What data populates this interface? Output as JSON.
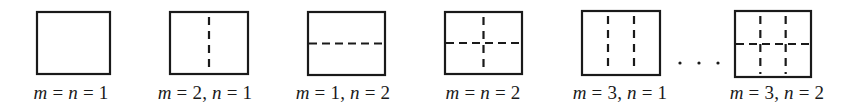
{
  "figure": {
    "stroke_color": "#1a1a1a",
    "panels": [
      {
        "id": "p1",
        "m": 1,
        "n": 1,
        "label_parts": [
          "m",
          " = ",
          "n",
          " = 1"
        ],
        "box": {
          "x": 37,
          "y": 12,
          "w": 73,
          "h": 62
        },
        "center_x": 71
      },
      {
        "id": "p2",
        "m": 2,
        "n": 1,
        "label_parts": [
          "m",
          " = 2, ",
          "n",
          " = 1"
        ],
        "box": {
          "x": 170,
          "y": 12,
          "w": 78,
          "h": 62
        },
        "center_x": 205
      },
      {
        "id": "p3",
        "m": 1,
        "n": 2,
        "label_parts": [
          "m",
          " = 1, ",
          "n",
          " = 2"
        ],
        "box": {
          "x": 308,
          "y": 12,
          "w": 77,
          "h": 63
        },
        "center_x": 343
      },
      {
        "id": "p4",
        "m": 2,
        "n": 2,
        "label_parts": [
          "m",
          " = ",
          "n",
          " = 2"
        ],
        "box": {
          "x": 445,
          "y": 12,
          "w": 77,
          "h": 62
        },
        "center_x": 483
      },
      {
        "id": "p5",
        "m": 3,
        "n": 1,
        "label_parts": [
          "m",
          " = 3, ",
          "n",
          " = 1"
        ],
        "box": {
          "x": 582,
          "y": 11,
          "w": 78,
          "h": 64
        },
        "center_x": 620
      },
      {
        "id": "p6",
        "m": 3,
        "n": 2,
        "label_parts": [
          "m",
          " = 3, ",
          "n",
          " = 2"
        ],
        "box": {
          "x": 735,
          "y": 11,
          "w": 76,
          "h": 66
        },
        "center_x": 777
      }
    ],
    "ellipsis": {
      "text": ". . .",
      "dots_x": [
        680,
        699,
        718
      ],
      "y": 63
    }
  }
}
